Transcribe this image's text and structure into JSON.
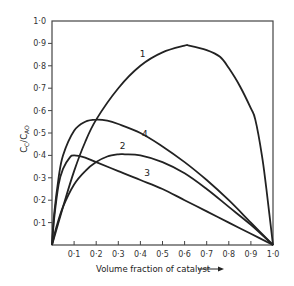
{
  "chart_data": {
    "type": "line",
    "title": "",
    "xlabel": "Volume fraction of catalyst",
    "xlabel_arrow": "→",
    "ylabel": "C_C/C_AO",
    "xlim": [
      0,
      1.0
    ],
    "ylim": [
      0,
      1.0
    ],
    "grid": false,
    "legend": "inline curve labels",
    "x_ticks": [
      "0·1",
      "0·2",
      "0·3",
      "0·4",
      "0·5",
      "0·6",
      "0·7",
      "0·8",
      "0·9",
      "1·0"
    ],
    "y_ticks": [
      "0·1",
      "0·2",
      "0·3",
      "0·4",
      "0·5",
      "0·6",
      "0·7",
      "0·8",
      "0·9",
      "1·0"
    ],
    "series": [
      {
        "name": "1",
        "label_pos": [
          0.41,
          0.84
        ],
        "x": [
          0,
          0.05,
          0.1,
          0.15,
          0.2,
          0.3,
          0.4,
          0.5,
          0.6,
          0.62,
          0.7,
          0.76,
          0.8,
          0.85,
          0.9,
          0.92,
          0.95,
          0.97,
          1.0
        ],
        "y": [
          0,
          0.17,
          0.33,
          0.46,
          0.56,
          0.7,
          0.8,
          0.86,
          0.89,
          0.89,
          0.87,
          0.84,
          0.79,
          0.71,
          0.61,
          0.56,
          0.4,
          0.25,
          0
        ]
      },
      {
        "name": "2",
        "label_pos": [
          0.32,
          0.43
        ],
        "x": [
          0,
          0.02,
          0.05,
          0.1,
          0.15,
          0.2,
          0.25,
          0.3,
          0.33,
          0.4,
          0.5,
          0.6,
          0.7,
          0.8,
          0.9,
          1.0
        ],
        "y": [
          0,
          0.08,
          0.17,
          0.27,
          0.33,
          0.37,
          0.395,
          0.405,
          0.405,
          0.4,
          0.37,
          0.32,
          0.25,
          0.17,
          0.09,
          0
        ]
      },
      {
        "name": "3",
        "label_pos": [
          0.43,
          0.31
        ],
        "x": [
          0,
          0.01,
          0.03,
          0.05,
          0.08,
          0.1,
          0.15,
          0.2,
          0.3,
          0.4,
          0.5,
          0.6,
          0.7,
          0.8,
          0.9,
          1.0
        ],
        "y": [
          0,
          0.12,
          0.27,
          0.34,
          0.39,
          0.4,
          0.39,
          0.37,
          0.33,
          0.29,
          0.25,
          0.2,
          0.15,
          0.1,
          0.05,
          0
        ]
      },
      {
        "name": "4",
        "label_pos": [
          0.42,
          0.48
        ],
        "x": [
          0,
          0.01,
          0.03,
          0.05,
          0.1,
          0.15,
          0.2,
          0.25,
          0.3,
          0.4,
          0.5,
          0.6,
          0.7,
          0.8,
          0.9,
          1.0
        ],
        "y": [
          0,
          0.14,
          0.3,
          0.4,
          0.51,
          0.55,
          0.56,
          0.555,
          0.54,
          0.5,
          0.44,
          0.37,
          0.29,
          0.2,
          0.1,
          0
        ]
      }
    ]
  },
  "colors": {
    "ink": "#222222",
    "background": "#ffffff"
  }
}
